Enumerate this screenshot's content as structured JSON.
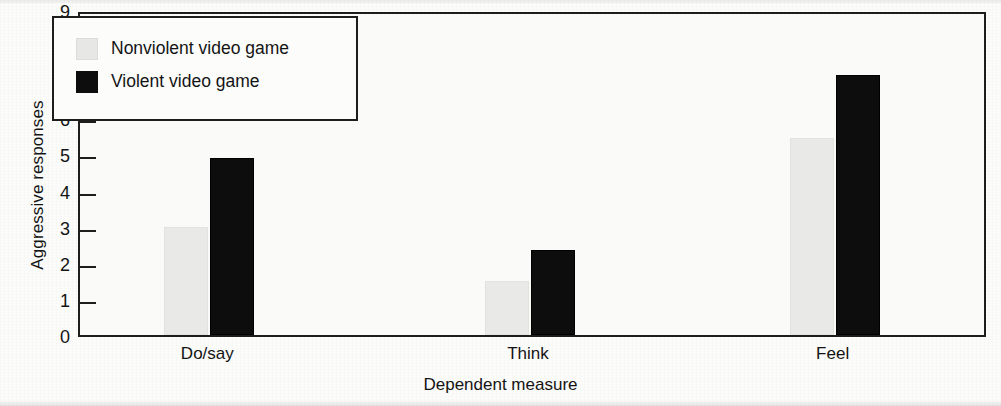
{
  "chart_data": {
    "type": "bar",
    "title": "",
    "xlabel": "Dependent measure",
    "ylabel": "Aggressive responses",
    "categories": [
      "Do/say",
      "Think",
      "Feel"
    ],
    "series": [
      {
        "name": "Nonviolent video game",
        "color": "#e9e9e7",
        "values": [
          3.0,
          1.5,
          5.45
        ]
      },
      {
        "name": "Violent video game",
        "color": "#0d0d0d",
        "values": [
          4.9,
          2.35,
          7.2
        ]
      }
    ],
    "ylim": [
      0,
      9
    ],
    "yticks": [
      0,
      1,
      2,
      3,
      4,
      5,
      6,
      7,
      8,
      9
    ],
    "ytick_labels": [
      "0",
      "1",
      "2",
      "3",
      "4",
      "5",
      "6",
      "7",
      "8",
      "9"
    ],
    "grid": false,
    "legend_position": "upper-left-inside"
  },
  "legend": {
    "entries": [
      {
        "label": "Nonviolent video game",
        "swatch": "light-gray"
      },
      {
        "label": "Violent video game",
        "swatch": "black"
      }
    ]
  }
}
